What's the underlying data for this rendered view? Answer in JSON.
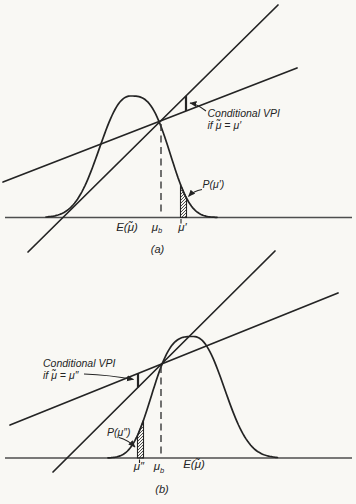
{
  "colors": {
    "ink": "#242424",
    "paper": "#f9f8f4"
  },
  "panel_a": {
    "annotation": {
      "line1": "Conditional VPI",
      "line2": "if μ̃ = μ′"
    },
    "prob_label": "P(μ′)",
    "axis_labels": {
      "expectation": "E(μ̃)",
      "mu_b": {
        "main": "μ",
        "sub": "b"
      },
      "mu_prime": "μ′"
    },
    "panel_label": "(a)"
  },
  "panel_b": {
    "annotation": {
      "line1": "Conditional VPI",
      "line2": "if μ̃ = μ″"
    },
    "prob_label": "P(μ″)",
    "axis_labels": {
      "mu_double_prime": "μ″",
      "mu_b": {
        "main": "μ",
        "sub": "b"
      },
      "expectation": "E(μ̃)"
    },
    "panel_label": "(b)"
  }
}
